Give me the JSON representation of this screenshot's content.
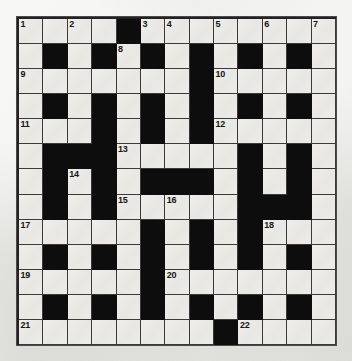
{
  "puzzle": {
    "title": "Crossword Grid",
    "type": "crossword",
    "columns": 13,
    "rows": 13,
    "colors": {
      "block": "#0d0d0d",
      "cell": "#eceae6",
      "grid_line": "#3a3a3a",
      "paper": "#e9e9e7",
      "number_text": "#151515"
    },
    "clue_numbers_visible": [
      "1",
      "2",
      "3",
      "4",
      "5",
      "6",
      "7",
      "8",
      "9",
      "10",
      "11",
      "12",
      "13",
      "14",
      "15",
      "16",
      "17",
      "18",
      "19",
      "20",
      "21",
      "22"
    ],
    "grid": [
      [
        {
          "block": false,
          "num": "1"
        },
        {
          "block": false,
          "num": ""
        },
        {
          "block": false,
          "num": "2"
        },
        {
          "block": false,
          "num": ""
        },
        {
          "block": true,
          "num": ""
        },
        {
          "block": false,
          "num": "3"
        },
        {
          "block": false,
          "num": "4"
        },
        {
          "block": false,
          "num": ""
        },
        {
          "block": false,
          "num": "5"
        },
        {
          "block": false,
          "num": ""
        },
        {
          "block": false,
          "num": "6"
        },
        {
          "block": false,
          "num": ""
        },
        {
          "block": false,
          "num": "7"
        }
      ],
      [
        {
          "block": false,
          "num": ""
        },
        {
          "block": true,
          "num": ""
        },
        {
          "block": false,
          "num": ""
        },
        {
          "block": true,
          "num": ""
        },
        {
          "block": false,
          "num": "8"
        },
        {
          "block": true,
          "num": ""
        },
        {
          "block": false,
          "num": ""
        },
        {
          "block": true,
          "num": ""
        },
        {
          "block": false,
          "num": ""
        },
        {
          "block": true,
          "num": ""
        },
        {
          "block": false,
          "num": ""
        },
        {
          "block": true,
          "num": ""
        },
        {
          "block": false,
          "num": ""
        }
      ],
      [
        {
          "block": false,
          "num": "9"
        },
        {
          "block": false,
          "num": ""
        },
        {
          "block": false,
          "num": ""
        },
        {
          "block": false,
          "num": ""
        },
        {
          "block": false,
          "num": ""
        },
        {
          "block": false,
          "num": ""
        },
        {
          "block": false,
          "num": ""
        },
        {
          "block": true,
          "num": ""
        },
        {
          "block": false,
          "num": "10"
        },
        {
          "block": false,
          "num": ""
        },
        {
          "block": false,
          "num": ""
        },
        {
          "block": false,
          "num": ""
        },
        {
          "block": false,
          "num": ""
        }
      ],
      [
        {
          "block": false,
          "num": ""
        },
        {
          "block": true,
          "num": ""
        },
        {
          "block": false,
          "num": ""
        },
        {
          "block": true,
          "num": ""
        },
        {
          "block": false,
          "num": ""
        },
        {
          "block": true,
          "num": ""
        },
        {
          "block": false,
          "num": ""
        },
        {
          "block": true,
          "num": ""
        },
        {
          "block": false,
          "num": ""
        },
        {
          "block": true,
          "num": ""
        },
        {
          "block": false,
          "num": ""
        },
        {
          "block": true,
          "num": ""
        },
        {
          "block": false,
          "num": ""
        }
      ],
      [
        {
          "block": false,
          "num": "11"
        },
        {
          "block": false,
          "num": ""
        },
        {
          "block": false,
          "num": ""
        },
        {
          "block": true,
          "num": ""
        },
        {
          "block": false,
          "num": ""
        },
        {
          "block": true,
          "num": ""
        },
        {
          "block": false,
          "num": ""
        },
        {
          "block": true,
          "num": ""
        },
        {
          "block": false,
          "num": "12"
        },
        {
          "block": false,
          "num": ""
        },
        {
          "block": false,
          "num": ""
        },
        {
          "block": false,
          "num": ""
        },
        {
          "block": false,
          "num": ""
        }
      ],
      [
        {
          "block": false,
          "num": ""
        },
        {
          "block": true,
          "num": ""
        },
        {
          "block": true,
          "num": ""
        },
        {
          "block": true,
          "num": ""
        },
        {
          "block": false,
          "num": "13"
        },
        {
          "block": false,
          "num": ""
        },
        {
          "block": false,
          "num": ""
        },
        {
          "block": false,
          "num": ""
        },
        {
          "block": false,
          "num": ""
        },
        {
          "block": true,
          "num": ""
        },
        {
          "block": false,
          "num": ""
        },
        {
          "block": true,
          "num": ""
        },
        {
          "block": false,
          "num": ""
        }
      ],
      [
        {
          "block": false,
          "num": ""
        },
        {
          "block": true,
          "num": ""
        },
        {
          "block": false,
          "num": "14"
        },
        {
          "block": true,
          "num": ""
        },
        {
          "block": false,
          "num": ""
        },
        {
          "block": true,
          "num": ""
        },
        {
          "block": true,
          "num": ""
        },
        {
          "block": true,
          "num": ""
        },
        {
          "block": false,
          "num": ""
        },
        {
          "block": true,
          "num": ""
        },
        {
          "block": false,
          "num": ""
        },
        {
          "block": true,
          "num": ""
        },
        {
          "block": false,
          "num": ""
        }
      ],
      [
        {
          "block": false,
          "num": ""
        },
        {
          "block": true,
          "num": ""
        },
        {
          "block": false,
          "num": ""
        },
        {
          "block": true,
          "num": ""
        },
        {
          "block": false,
          "num": "15"
        },
        {
          "block": false,
          "num": ""
        },
        {
          "block": false,
          "num": "16"
        },
        {
          "block": false,
          "num": ""
        },
        {
          "block": false,
          "num": ""
        },
        {
          "block": true,
          "num": ""
        },
        {
          "block": true,
          "num": ""
        },
        {
          "block": true,
          "num": ""
        },
        {
          "block": false,
          "num": ""
        }
      ],
      [
        {
          "block": false,
          "num": "17"
        },
        {
          "block": false,
          "num": ""
        },
        {
          "block": false,
          "num": ""
        },
        {
          "block": false,
          "num": ""
        },
        {
          "block": false,
          "num": ""
        },
        {
          "block": true,
          "num": ""
        },
        {
          "block": false,
          "num": ""
        },
        {
          "block": true,
          "num": ""
        },
        {
          "block": false,
          "num": ""
        },
        {
          "block": true,
          "num": ""
        },
        {
          "block": false,
          "num": "18"
        },
        {
          "block": false,
          "num": ""
        },
        {
          "block": false,
          "num": ""
        }
      ],
      [
        {
          "block": false,
          "num": ""
        },
        {
          "block": true,
          "num": ""
        },
        {
          "block": false,
          "num": ""
        },
        {
          "block": true,
          "num": ""
        },
        {
          "block": false,
          "num": ""
        },
        {
          "block": true,
          "num": ""
        },
        {
          "block": false,
          "num": ""
        },
        {
          "block": true,
          "num": ""
        },
        {
          "block": false,
          "num": ""
        },
        {
          "block": true,
          "num": ""
        },
        {
          "block": false,
          "num": ""
        },
        {
          "block": true,
          "num": ""
        },
        {
          "block": false,
          "num": ""
        }
      ],
      [
        {
          "block": false,
          "num": "19"
        },
        {
          "block": false,
          "num": ""
        },
        {
          "block": false,
          "num": ""
        },
        {
          "block": false,
          "num": ""
        },
        {
          "block": false,
          "num": ""
        },
        {
          "block": true,
          "num": ""
        },
        {
          "block": false,
          "num": "20"
        },
        {
          "block": false,
          "num": ""
        },
        {
          "block": false,
          "num": ""
        },
        {
          "block": false,
          "num": ""
        },
        {
          "block": false,
          "num": ""
        },
        {
          "block": false,
          "num": ""
        },
        {
          "block": false,
          "num": ""
        }
      ],
      [
        {
          "block": false,
          "num": ""
        },
        {
          "block": true,
          "num": ""
        },
        {
          "block": false,
          "num": ""
        },
        {
          "block": true,
          "num": ""
        },
        {
          "block": false,
          "num": ""
        },
        {
          "block": true,
          "num": ""
        },
        {
          "block": false,
          "num": ""
        },
        {
          "block": true,
          "num": ""
        },
        {
          "block": false,
          "num": ""
        },
        {
          "block": true,
          "num": ""
        },
        {
          "block": false,
          "num": ""
        },
        {
          "block": true,
          "num": ""
        },
        {
          "block": false,
          "num": ""
        }
      ],
      [
        {
          "block": false,
          "num": "21"
        },
        {
          "block": false,
          "num": ""
        },
        {
          "block": false,
          "num": ""
        },
        {
          "block": false,
          "num": ""
        },
        {
          "block": false,
          "num": ""
        },
        {
          "block": false,
          "num": ""
        },
        {
          "block": false,
          "num": ""
        },
        {
          "block": false,
          "num": ""
        },
        {
          "block": true,
          "num": ""
        },
        {
          "block": false,
          "num": "22"
        },
        {
          "block": false,
          "num": ""
        },
        {
          "block": false,
          "num": ""
        },
        {
          "block": false,
          "num": ""
        }
      ]
    ]
  }
}
